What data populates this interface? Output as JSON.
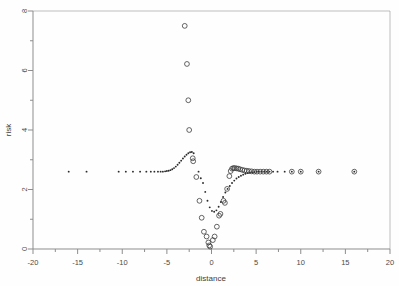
{
  "chart_data": {
    "type": "scatter",
    "title": "",
    "xlabel": "distance",
    "ylabel": "risk",
    "xlim": [
      -20,
      20
    ],
    "ylim": [
      0,
      8
    ],
    "grid": false,
    "legend": "none",
    "xticks": [
      -20,
      -15,
      -10,
      -5,
      0,
      5,
      10,
      15,
      20
    ],
    "xtick_labels": [
      "-20",
      "-15",
      "-10",
      "-5",
      "0",
      "5",
      "10",
      "15",
      "20"
    ],
    "x_minor_ticks": [
      -17.5,
      -12.5,
      -7.5,
      -2.5,
      2.5,
      7.5,
      12.5,
      17.5
    ],
    "yticks": [
      0,
      2,
      4,
      6,
      8
    ],
    "ytick_labels": [
      "0",
      "2",
      "4",
      "6",
      "8"
    ],
    "y_minor_ticks": [
      1,
      3,
      5,
      7
    ],
    "baseline_value": 2.6,
    "series": [
      {
        "name": "fitted-dots",
        "marker": "filled-dot",
        "color": "#2b2b2b",
        "points": [
          [
            -16.0,
            2.6
          ],
          [
            -14.0,
            2.6
          ],
          [
            -10.4,
            2.6
          ],
          [
            -9.6,
            2.6
          ],
          [
            -8.8,
            2.6
          ],
          [
            -8.0,
            2.6
          ],
          [
            -7.3,
            2.6
          ],
          [
            -6.8,
            2.6
          ],
          [
            -6.4,
            2.6
          ],
          [
            -6.0,
            2.6
          ],
          [
            -5.7,
            2.6
          ],
          [
            -5.45,
            2.6
          ],
          [
            -5.2,
            2.61
          ],
          [
            -5.0,
            2.62
          ],
          [
            -4.8,
            2.63
          ],
          [
            -4.6,
            2.65
          ],
          [
            -4.4,
            2.68
          ],
          [
            -4.2,
            2.72
          ],
          [
            -4.0,
            2.77
          ],
          [
            -3.8,
            2.83
          ],
          [
            -3.6,
            2.9
          ],
          [
            -3.4,
            2.97
          ],
          [
            -3.2,
            3.04
          ],
          [
            -3.0,
            3.11
          ],
          [
            -2.8,
            3.17
          ],
          [
            -2.6,
            3.22
          ],
          [
            -2.4,
            3.25
          ],
          [
            -2.2,
            3.26
          ],
          [
            -2.0,
            3.22
          ],
          [
            -1.45,
            2.6
          ],
          [
            -1.2,
            2.38
          ],
          [
            -0.95,
            2.22
          ],
          [
            -0.7,
            1.92
          ],
          [
            -0.45,
            1.62
          ],
          [
            -0.2,
            1.4
          ],
          [
            0.05,
            1.28
          ],
          [
            0.3,
            1.25
          ],
          [
            0.55,
            1.3
          ],
          [
            0.8,
            1.42
          ],
          [
            1.05,
            1.58
          ],
          [
            1.3,
            1.75
          ],
          [
            1.55,
            1.9
          ],
          [
            1.8,
            2.02
          ],
          [
            2.05,
            2.12
          ],
          [
            2.3,
            2.22
          ],
          [
            2.55,
            2.3
          ],
          [
            2.8,
            2.37
          ],
          [
            3.05,
            2.42
          ],
          [
            3.3,
            2.46
          ],
          [
            3.55,
            2.5
          ],
          [
            3.8,
            2.53
          ],
          [
            4.05,
            2.55
          ],
          [
            4.3,
            2.57
          ],
          [
            4.55,
            2.58
          ],
          [
            4.8,
            2.59
          ],
          [
            5.05,
            2.6
          ],
          [
            5.3,
            2.6
          ],
          [
            5.6,
            2.6
          ],
          [
            5.9,
            2.6
          ],
          [
            6.2,
            2.6
          ],
          [
            6.5,
            2.6
          ],
          [
            6.9,
            2.6
          ],
          [
            7.4,
            2.6
          ],
          [
            8.2,
            2.6
          ],
          [
            9.0,
            2.6
          ],
          [
            10.0,
            2.6
          ],
          [
            12.0,
            2.6
          ],
          [
            16.0,
            2.6
          ]
        ]
      },
      {
        "name": "observed-circles",
        "marker": "open-circle",
        "color": "#3d3d3d",
        "points": [
          [
            -3.0,
            7.5
          ],
          [
            -2.75,
            6.22
          ],
          [
            -2.6,
            5.0
          ],
          [
            -2.5,
            4.0
          ],
          [
            -2.1,
            3.05
          ],
          [
            -2.05,
            2.95
          ],
          [
            -1.7,
            2.42
          ],
          [
            -1.35,
            1.62
          ],
          [
            -1.1,
            1.05
          ],
          [
            -0.85,
            0.58
          ],
          [
            -0.55,
            0.42
          ],
          [
            -0.35,
            0.22
          ],
          [
            -0.25,
            0.12
          ],
          [
            -0.15,
            0.08
          ],
          [
            0.15,
            0.3
          ],
          [
            0.35,
            0.42
          ],
          [
            0.6,
            0.75
          ],
          [
            0.85,
            1.12
          ],
          [
            1.0,
            1.18
          ],
          [
            1.35,
            1.62
          ],
          [
            1.5,
            1.55
          ],
          [
            1.75,
            2.02
          ],
          [
            2.0,
            2.45
          ],
          [
            2.15,
            2.62
          ],
          [
            2.3,
            2.7
          ],
          [
            2.45,
            2.72
          ],
          [
            2.6,
            2.72
          ],
          [
            2.8,
            2.71
          ],
          [
            3.0,
            2.7
          ],
          [
            3.2,
            2.68
          ],
          [
            3.45,
            2.66
          ],
          [
            3.7,
            2.64
          ],
          [
            3.95,
            2.63
          ],
          [
            4.2,
            2.62
          ],
          [
            4.5,
            2.61
          ],
          [
            4.8,
            2.6
          ],
          [
            5.1,
            2.6
          ],
          [
            5.45,
            2.6
          ],
          [
            5.8,
            2.6
          ],
          [
            6.15,
            2.6
          ],
          [
            6.5,
            2.6
          ],
          [
            9.0,
            2.6
          ],
          [
            10.0,
            2.6
          ],
          [
            12.0,
            2.6
          ],
          [
            16.0,
            2.6
          ]
        ]
      }
    ]
  },
  "axes": {
    "x_title": "distance",
    "y_title": "risk"
  }
}
